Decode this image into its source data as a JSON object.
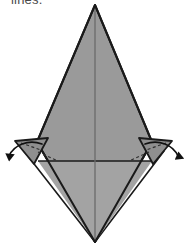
{
  "page": {
    "width": 187,
    "height": 248,
    "background": "#ffffff"
  },
  "caption": {
    "text": "lines.",
    "color": "#4a4a4a",
    "clipped_at_top": true
  },
  "figure": {
    "colors": {
      "paper_fill": "#9a9a9a",
      "paper_fill_light": "#a3a3a3",
      "flap_fill": "#8f8f8f",
      "backside_fill": "#ffffff",
      "outline": "#1a1a1a",
      "crease_line": "#1a1a1a",
      "dashed_crease": "#3a3a3a",
      "arrow": "#111111"
    },
    "shapes": {
      "main_diamond": {
        "name": "main-gray-diamond",
        "points": "95,5 152,142 95,242 37,142"
      },
      "left_white_flap": {
        "name": "left-white-underlayer",
        "points": "37,142 95,242 26,152"
      },
      "right_white_flap": {
        "name": "right-white-underlayer",
        "points": "152,142 95,242 161,152"
      },
      "left_small_flap": {
        "name": "left-small-folding-flap",
        "points": "16,141 47,139 33,163"
      },
      "right_small_flap": {
        "name": "right-small-folding-flap",
        "points": "171,141 140,139 155,163"
      },
      "horizontal_crease": {
        "name": "horizontal-crease-line",
        "from": "38,161",
        "to": "152,161"
      },
      "vertical_crease": {
        "name": "vertical-crease-line",
        "from": "95,5",
        "to": "95,242"
      }
    },
    "arrows": [
      {
        "name": "left-unfold-arrow",
        "direction": "down-left",
        "path": "M 40,143 C 28,140 14,146 9,160",
        "head_at": "9,160"
      },
      {
        "name": "right-unfold-arrow",
        "direction": "down-right",
        "path": "M 147,143 C 159,140 173,146 178,160",
        "head_at": "178,160"
      }
    ],
    "dashed_creases": [
      {
        "name": "left-dashed-crease",
        "from": "20,142",
        "to": "40,150"
      },
      {
        "name": "right-dashed-crease",
        "from": "167,142",
        "to": "147,150"
      },
      {
        "name": "left-inner-dashed-crease",
        "from": "36,150",
        "to": "58,160"
      },
      {
        "name": "right-inner-dashed-crease",
        "from": "151,150",
        "to": "129,160"
      }
    ]
  }
}
